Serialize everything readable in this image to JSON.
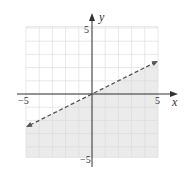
{
  "chart_data": {
    "type": "line",
    "title": "",
    "xlabel": "x",
    "ylabel": "y",
    "xlim": [
      -5,
      5
    ],
    "ylim": [
      -5,
      5
    ],
    "grid": true,
    "x_tick_labels": [
      "-5",
      "5"
    ],
    "y_tick_labels": [
      "5",
      "-5"
    ],
    "series": [
      {
        "name": "boundary line",
        "style": "dashed",
        "x": [
          -5,
          5
        ],
        "y": [
          -2.5,
          2.5
        ]
      }
    ],
    "shaded_region": "below boundary line (y < x/2)",
    "colors": {
      "shade": "#ebebeb",
      "grid": "#d8d8d8",
      "axis": "#333333",
      "line": "#555555"
    }
  },
  "labels": {
    "x_axis": "x",
    "y_axis": "y",
    "x_min": "−5",
    "x_max": "5",
    "y_max": "5",
    "y_min": "−5"
  }
}
